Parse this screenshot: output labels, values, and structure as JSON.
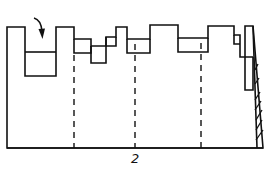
{
  "diagram": {
    "stroke_color": "#111111",
    "background": "#ffffff",
    "label": "2",
    "arrow": "curved-down-arrow",
    "dashed_lines_count": 3,
    "hatched_element": "wedge"
  }
}
